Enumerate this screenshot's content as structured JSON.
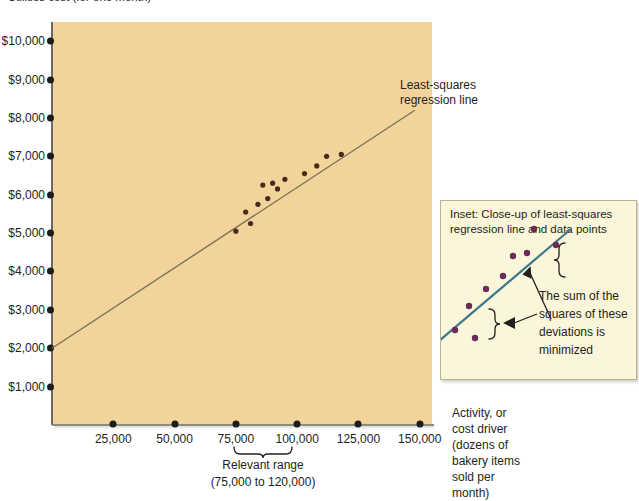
{
  "figure": {
    "top_caption": "Utilities cost (for one month)",
    "regression_label_line1": "Least-squares",
    "regression_label_line2": "regression line",
    "relevant_range_line1": "Relevant range",
    "relevant_range_line2": "(75,000 to 120,000)",
    "x_axis_label_lines": [
      "Activity, or",
      "cost driver",
      "(dozens of",
      "bakery items",
      "sold per",
      "month)"
    ]
  },
  "inset": {
    "title_line1": "Inset: Close-up of least-squares",
    "title_line2": "regression line and data points",
    "note_lines": [
      "The sum of the",
      "squares of these",
      "deviations is",
      "minimized"
    ],
    "background_color": "#fbf6da",
    "border_color": "#b9b396",
    "line_color": "#3e7a8c",
    "point_color": "#6b2a5a"
  },
  "colors": {
    "plot_background": "#f2d49a",
    "axis": "#6d6a63",
    "regression_line": "#7a7258",
    "data_point": "#4a2a1e",
    "text": "#231f20"
  },
  "chart_data": {
    "type": "scatter",
    "title": "Utilities cost (for one month)",
    "xlabel": "Activity, or cost driver (dozens of bakery items sold per month)",
    "ylabel": "Utilities cost (for one month)",
    "xlim": [
      0,
      155000
    ],
    "ylim": [
      0,
      10500
    ],
    "grid": false,
    "legend": "none",
    "x_ticks": [
      25000,
      50000,
      75000,
      100000,
      125000,
      150000
    ],
    "x_tick_labels": [
      "25,000",
      "50,000",
      "75,000",
      "100,000",
      "125,000",
      "150,000"
    ],
    "y_ticks": [
      1000,
      2000,
      3000,
      4000,
      5000,
      6000,
      7000,
      8000,
      9000,
      10000
    ],
    "y_tick_labels": [
      "$1,000",
      "$2,000",
      "$3,000",
      "$4,000",
      "$5,000",
      "$6,000",
      "$7,000",
      "$8,000",
      "$9,000",
      "$10,000"
    ],
    "points": [
      {
        "x": 75000,
        "y": 5050
      },
      {
        "x": 79000,
        "y": 5550
      },
      {
        "x": 81000,
        "y": 5250
      },
      {
        "x": 84000,
        "y": 5750
      },
      {
        "x": 86000,
        "y": 6250
      },
      {
        "x": 88000,
        "y": 5900
      },
      {
        "x": 90000,
        "y": 6300
      },
      {
        "x": 92000,
        "y": 6150
      },
      {
        "x": 95000,
        "y": 6400
      },
      {
        "x": 103000,
        "y": 6550
      },
      {
        "x": 108000,
        "y": 6750
      },
      {
        "x": 112000,
        "y": 7000
      },
      {
        "x": 118000,
        "y": 7050
      }
    ],
    "regression_line": {
      "name": "Least-squares regression line",
      "x_start": 0,
      "y_start": 2000,
      "x_end": 148000,
      "y_end": 8200,
      "intercept": 2000,
      "slope_per_unit": 0.0419
    },
    "relevant_range": {
      "from": 75000,
      "to": 120000,
      "label": "Relevant range (75,000 to 120,000)"
    },
    "inset_points": [
      {
        "x": 14,
        "y": 129
      },
      {
        "x": 34,
        "y": 137
      },
      {
        "x": 28,
        "y": 105
      },
      {
        "x": 45,
        "y": 88
      },
      {
        "x": 62,
        "y": 75
      },
      {
        "x": 72,
        "y": 55
      },
      {
        "x": 86,
        "y": 52
      },
      {
        "x": 93,
        "y": 28
      },
      {
        "x": 115,
        "y": 44
      }
    ],
    "inset_line": {
      "x1": -2,
      "y1": 140,
      "x2": 130,
      "y2": 28
    }
  }
}
